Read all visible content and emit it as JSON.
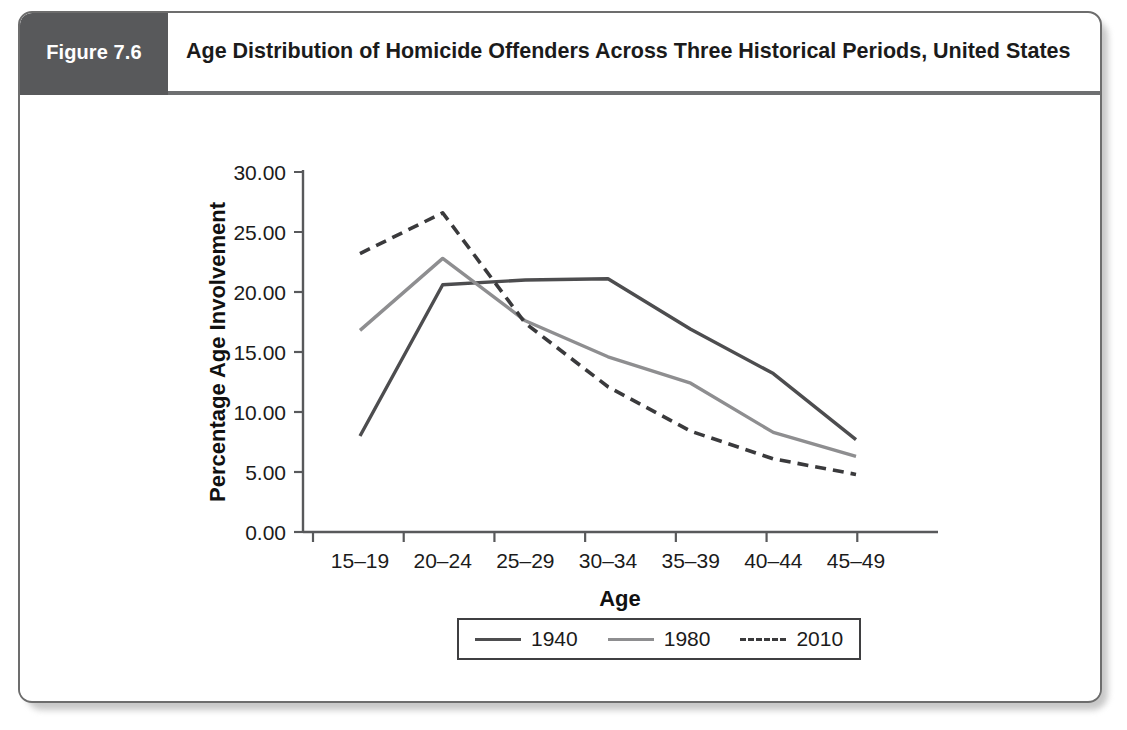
{
  "figure": {
    "tab_label": "Figure 7.6",
    "title": "Age Distribution of Homicide Offenders Across Three Historical Periods, United States",
    "tab_color": "#58595b"
  },
  "chart_data": {
    "type": "line",
    "title": "Age Distribution of Homicide Offenders Across Three Historical Periods, United States",
    "xlabel": "Age",
    "ylabel": "Percentage Age Involvement",
    "categories": [
      "15–19",
      "20–24",
      "25–29",
      "30–34",
      "35–39",
      "40–44",
      "45–49"
    ],
    "ytick_labels": [
      "0.00",
      "5.00",
      "10.00",
      "15.00",
      "20.00",
      "25.00",
      "30.00"
    ],
    "yticks": [
      0,
      5,
      10,
      15,
      20,
      25,
      30
    ],
    "ylim": [
      0,
      30
    ],
    "grid": false,
    "legend_position": "bottom",
    "series": [
      {
        "name": "1940",
        "style": "solid",
        "color": "#4d4d4f",
        "values": [
          8.0,
          20.6,
          21.0,
          21.1,
          16.9,
          13.2,
          7.7
        ]
      },
      {
        "name": "1980",
        "style": "solid",
        "color": "#8e8e90",
        "values": [
          16.8,
          22.8,
          17.6,
          14.6,
          12.4,
          8.3,
          6.3
        ]
      },
      {
        "name": "2010",
        "style": "dashed",
        "color": "#3a3a3c",
        "values": [
          23.2,
          26.6,
          17.4,
          12.1,
          8.4,
          6.1,
          4.8
        ]
      }
    ]
  },
  "legend": {
    "entries": [
      {
        "label": "1940"
      },
      {
        "label": "1980"
      },
      {
        "label": "2010"
      }
    ]
  }
}
